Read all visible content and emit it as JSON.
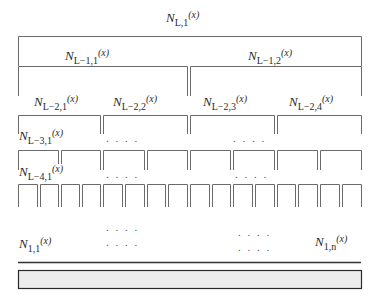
{
  "diagram": {
    "type": "hierarchical-tree-partition",
    "levels": [
      {
        "level": "L",
        "nodes": [
          {
            "name": "N",
            "sub": "L,1",
            "arg": "(x)"
          }
        ]
      },
      {
        "level": "L-1",
        "nodes": [
          {
            "name": "N",
            "sub": "L−1,1",
            "arg": "(x)"
          },
          {
            "name": "N",
            "sub": "L−1,2",
            "arg": "(x)"
          }
        ]
      },
      {
        "level": "L-2",
        "nodes": [
          {
            "name": "N",
            "sub": "L−2,1",
            "arg": "(x)"
          },
          {
            "name": "N",
            "sub": "L−2,2",
            "arg": "(x)"
          },
          {
            "name": "N",
            "sub": "L−2,3",
            "arg": "(x)"
          },
          {
            "name": "N",
            "sub": "L−2,4",
            "arg": "(x)"
          }
        ]
      },
      {
        "level": "L-3",
        "nodes": [
          {
            "name": "N",
            "sub": "L−3,1",
            "arg": "(x)"
          }
        ],
        "box_count": 8
      },
      {
        "level": "L-4",
        "nodes": [
          {
            "name": "N",
            "sub": "L−4,1",
            "arg": "(x)"
          }
        ],
        "box_count": 16
      },
      {
        "level": "1",
        "nodes": [
          {
            "name": "N",
            "sub": "1,1",
            "arg": "(x)"
          },
          {
            "name": "N",
            "sub": "1,n",
            "arg": "(x)"
          }
        ]
      }
    ],
    "ellipsis": ". . . .",
    "colors": {
      "line": "#555555",
      "bar_fill": "#ececec",
      "bar_border": "#2a2a2a"
    }
  }
}
